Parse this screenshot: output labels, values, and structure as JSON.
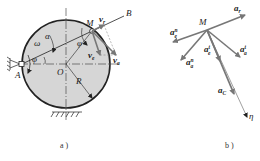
{
  "figure_a": {
    "caption": "a )",
    "labels": {
      "point_M": "M",
      "point_B": "B",
      "point_A": "A",
      "point_O": "O",
      "radius": "R",
      "omega": "ω",
      "alpha": "α",
      "phi_1": "φ",
      "phi_2": "φ",
      "v_r": "v",
      "v_r_sub": "r",
      "v_a": "v",
      "v_a_sub": "a",
      "v_e": "v",
      "v_e_sub": "e"
    }
  },
  "figure_b": {
    "caption": "b )",
    "labels": {
      "point_M": "M",
      "a_r": "a",
      "a_r_sub": "r",
      "a_e_n": "a",
      "a_e_n_sup": "n",
      "a_e_n_sub": "e",
      "a_a_n": "a",
      "a_a_n_sup": "n",
      "a_a_n_sub": "a",
      "a_e_t": "a",
      "a_e_t_sup": "t",
      "a_e_t_sub": "e",
      "a_a_t": "a",
      "a_a_t_sup": "t",
      "a_a_t_sub": "a",
      "a_C": "a",
      "a_C_sub": "C",
      "axis_eta": "η"
    }
  },
  "colors": {
    "disk_fill": "#d6d6d6",
    "outline": "#222222",
    "vector": "#777777"
  }
}
